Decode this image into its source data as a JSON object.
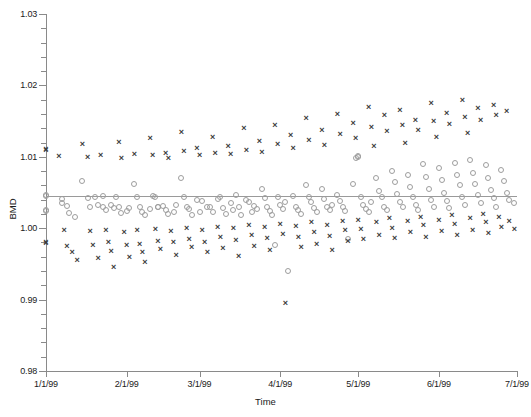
{
  "chart_data": {
    "type": "scatter",
    "title": "",
    "xlabel": "Time",
    "ylabel": "BMD",
    "ylim": [
      0.98,
      1.03
    ],
    "ytick_labels": [
      "0.98",
      "0.99",
      "1.00",
      "1.01",
      "1.02",
      "1.03"
    ],
    "ytick_values": [
      0.98,
      0.99,
      1.0,
      1.01,
      1.02,
      1.03
    ],
    "yminor_step": 0.002,
    "xtick_labels": [
      "1/1/99",
      "2/1/99",
      "3/1/99",
      "4/1/99",
      "5/1/99",
      "6/1/99",
      "7/1/99"
    ],
    "xtick_values": [
      0,
      31,
      59,
      90,
      120,
      151,
      181
    ],
    "xlim": [
      0,
      181
    ],
    "grid": false,
    "legend_position": "none",
    "annotations": [
      {
        "type": "hline",
        "y": 1.0045,
        "color": "#9a9a9a",
        "label": ""
      }
    ],
    "series": [
      {
        "name": "circle-series",
        "marker": "circle",
        "color": "#9d9d9d",
        "points": [
          [
            0,
            1.0045
          ],
          [
            0,
            1.0046
          ],
          [
            0,
            1.0025
          ],
          [
            0,
            1.0024
          ],
          [
            6,
            1.0041
          ],
          [
            6,
            1.0035
          ],
          [
            8,
            1.0031
          ],
          [
            9,
            1.0021
          ],
          [
            11,
            1.0015
          ],
          [
            14,
            1.0066
          ],
          [
            16,
            1.0042
          ],
          [
            17,
            1.003
          ],
          [
            19,
            1.0044
          ],
          [
            20,
            1.0032
          ],
          [
            22,
            1.0045
          ],
          [
            22,
            1.0029
          ],
          [
            23,
            1.0026
          ],
          [
            25,
            1.0033
          ],
          [
            26,
            1.0028
          ],
          [
            27,
            1.0043
          ],
          [
            28,
            1.003
          ],
          [
            29,
            1.0021
          ],
          [
            31,
            1.0024
          ],
          [
            32,
            1.0028
          ],
          [
            34,
            1.0062
          ],
          [
            35,
            1.0044
          ],
          [
            36,
            1.003
          ],
          [
            37,
            1.0022
          ],
          [
            38,
            1.0018
          ],
          [
            40,
            1.0027
          ],
          [
            41,
            1.0045
          ],
          [
            42,
            1.0044
          ],
          [
            43,
            1.003
          ],
          [
            43,
            1.0029
          ],
          [
            45,
            1.0031
          ],
          [
            46,
            1.0025
          ],
          [
            47,
            1.002
          ],
          [
            49,
            1.0022
          ],
          [
            50,
            1.0032
          ],
          [
            52,
            1.007
          ],
          [
            53,
            1.0043
          ],
          [
            54,
            1.0029
          ],
          [
            55,
            1.0027
          ],
          [
            56,
            1.0018
          ],
          [
            58,
            1.0039
          ],
          [
            59,
            1.0023
          ],
          [
            60,
            1.0038
          ],
          [
            62,
            1.0029
          ],
          [
            63,
            1.003
          ],
          [
            64,
            1.0022
          ],
          [
            66,
            1.0041
          ],
          [
            67,
            1.0044
          ],
          [
            68,
            1.0028
          ],
          [
            69,
            1.002
          ],
          [
            71,
            1.0035
          ],
          [
            72,
            1.0026
          ],
          [
            73,
            1.0046
          ],
          [
            74,
            1.0029
          ],
          [
            75,
            1.0018
          ],
          [
            77,
            1.004
          ],
          [
            78,
            1.0036
          ],
          [
            79,
            1.0022
          ],
          [
            80,
            1.0031
          ],
          [
            81,
            1.0027
          ],
          [
            83,
            1.0055
          ],
          [
            84,
            1.0042
          ],
          [
            85,
            1.003
          ],
          [
            86,
            1.0024
          ],
          [
            87,
            1.0019
          ],
          [
            88,
            0.9977
          ],
          [
            89,
            1.0044
          ],
          [
            90,
            1.0033
          ],
          [
            91,
            1.0027
          ],
          [
            92,
            1.0037
          ],
          [
            93,
            0.994
          ],
          [
            95,
            1.0045
          ],
          [
            96,
            1.003
          ],
          [
            97,
            1.0025
          ],
          [
            98,
            1.002
          ],
          [
            100,
            1.006
          ],
          [
            101,
            1.0043
          ],
          [
            102,
            1.0036
          ],
          [
            103,
            1.0028
          ],
          [
            104,
            1.0022
          ],
          [
            106,
            1.0055
          ],
          [
            107,
            1.0041
          ],
          [
            108,
            1.003
          ],
          [
            109,
            1.0026
          ],
          [
            110,
            1.0033
          ],
          [
            112,
            1.0046
          ],
          [
            113,
            1.0038
          ],
          [
            114,
            1.0029
          ],
          [
            115,
            1.0024
          ],
          [
            116,
            0.9985
          ],
          [
            118,
            1.0062
          ],
          [
            119,
            1.0099
          ],
          [
            120,
            1.0101
          ],
          [
            120,
            1.01
          ],
          [
            121,
            1.0044
          ],
          [
            122,
            1.0032
          ],
          [
            123,
            1.0027
          ],
          [
            124,
            1.0022
          ],
          [
            125,
            1.0036
          ],
          [
            127,
            1.007
          ],
          [
            128,
            1.0052
          ],
          [
            129,
            1.0043
          ],
          [
            130,
            1.003
          ],
          [
            131,
            1.0025
          ],
          [
            133,
            1.008
          ],
          [
            134,
            1.0065
          ],
          [
            135,
            1.0048
          ],
          [
            136,
            1.0036
          ],
          [
            137,
            1.0029
          ],
          [
            139,
            1.0075
          ],
          [
            140,
            1.0058
          ],
          [
            141,
            1.0044
          ],
          [
            142,
            1.0032
          ],
          [
            143,
            1.0026
          ],
          [
            145,
            1.009
          ],
          [
            146,
            1.0072
          ],
          [
            147,
            1.0055
          ],
          [
            148,
            1.004
          ],
          [
            149,
            1.003
          ],
          [
            151,
            1.0085
          ],
          [
            152,
            1.0068
          ],
          [
            153,
            1.005
          ],
          [
            154,
            1.0038
          ],
          [
            155,
            1.0028
          ],
          [
            157,
            1.0092
          ],
          [
            158,
            1.0074
          ],
          [
            159,
            1.006
          ],
          [
            160,
            1.0044
          ],
          [
            161,
            1.0033
          ],
          [
            163,
            1.0095
          ],
          [
            164,
            1.0078
          ],
          [
            165,
            1.0062
          ],
          [
            166,
            1.0046
          ],
          [
            167,
            1.0035
          ],
          [
            169,
            1.0088
          ],
          [
            170,
            1.007
          ],
          [
            171,
            1.0054
          ],
          [
            172,
            1.0042
          ],
          [
            173,
            1.003
          ],
          [
            175,
            1.0082
          ],
          [
            176,
            1.0066
          ],
          [
            177,
            1.005
          ],
          [
            178,
            1.004
          ],
          [
            180,
            1.0035
          ]
        ]
      },
      {
        "name": "x-series",
        "marker": "x",
        "color": "#3b3b3b",
        "points": [
          [
            0,
            1.011
          ],
          [
            0,
            1.0111
          ],
          [
            0,
            0.998
          ],
          [
            0,
            0.9979
          ],
          [
            5,
            1.0101
          ],
          [
            7,
            0.9997
          ],
          [
            8,
            0.9975
          ],
          [
            10,
            0.9966
          ],
          [
            12,
            0.9955
          ],
          [
            14,
            1.0118
          ],
          [
            16,
            1.01
          ],
          [
            17,
            0.9996
          ],
          [
            18,
            0.9977
          ],
          [
            20,
            0.9958
          ],
          [
            21,
            1.0103
          ],
          [
            23,
            0.9998
          ],
          [
            24,
            0.998
          ],
          [
            25,
            0.9968
          ],
          [
            26,
            0.9946
          ],
          [
            28,
            1.0121
          ],
          [
            29,
            1.0099
          ],
          [
            30,
            0.9994
          ],
          [
            31,
            0.9976
          ],
          [
            32,
            0.996
          ],
          [
            34,
            1.0104
          ],
          [
            35,
            0.9997
          ],
          [
            36,
            0.9978
          ],
          [
            37,
            0.9967
          ],
          [
            38,
            0.9952
          ],
          [
            40,
            1.0126
          ],
          [
            41,
            1.0102
          ],
          [
            42,
            0.9999
          ],
          [
            43,
            0.9982
          ],
          [
            44,
            0.9971
          ],
          [
            46,
            1.0105
          ],
          [
            47,
            1.0098
          ],
          [
            48,
            0.9996
          ],
          [
            49,
            0.998
          ],
          [
            50,
            0.9963
          ],
          [
            52,
            1.0135
          ],
          [
            53,
            1.0108
          ],
          [
            54,
            1.0
          ],
          [
            55,
            0.9985
          ],
          [
            56,
            0.9974
          ],
          [
            58,
            1.0112
          ],
          [
            59,
            1.0102
          ],
          [
            60,
            0.9998
          ],
          [
            61,
            0.9981
          ],
          [
            62,
            0.9966
          ],
          [
            64,
            1.0128
          ],
          [
            65,
            1.0106
          ],
          [
            66,
            1.0002
          ],
          [
            67,
            0.9988
          ],
          [
            68,
            0.9972
          ],
          [
            70,
            1.0115
          ],
          [
            71,
            1.0104
          ],
          [
            72,
            1.0
          ],
          [
            73,
            0.9983
          ],
          [
            74,
            0.9961
          ],
          [
            76,
            1.014
          ],
          [
            77,
            1.011
          ],
          [
            78,
            1.0004
          ],
          [
            79,
            0.999
          ],
          [
            80,
            0.9975
          ],
          [
            82,
            1.0122
          ],
          [
            83,
            1.0107
          ],
          [
            84,
            1.0001
          ],
          [
            85,
            0.9986
          ],
          [
            86,
            0.997
          ],
          [
            88,
            1.0145
          ],
          [
            89,
            1.0118
          ],
          [
            90,
            1.0006
          ],
          [
            91,
            0.9992
          ],
          [
            92,
            0.9895
          ],
          [
            94,
            1.013
          ],
          [
            95,
            1.0112
          ],
          [
            96,
            1.0003
          ],
          [
            97,
            0.9987
          ],
          [
            98,
            0.9973
          ],
          [
            100,
            1.0155
          ],
          [
            101,
            1.0124
          ],
          [
            102,
            1.0008
          ],
          [
            103,
            0.9995
          ],
          [
            104,
            0.9978
          ],
          [
            106,
            1.0138
          ],
          [
            107,
            1.0116
          ],
          [
            108,
            1.0005
          ],
          [
            109,
            0.9989
          ],
          [
            110,
            0.9969
          ],
          [
            112,
            1.016
          ],
          [
            113,
            1.0132
          ],
          [
            114,
            1.001
          ],
          [
            115,
            0.9997
          ],
          [
            116,
            0.9982
          ],
          [
            118,
            1.0148
          ],
          [
            119,
            1.0126
          ],
          [
            120,
            1.0012
          ],
          [
            121,
            0.9999
          ],
          [
            122,
            0.9985
          ],
          [
            124,
            1.017
          ],
          [
            125,
            1.0142
          ],
          [
            126,
            1.0115
          ],
          [
            127,
            1.0008
          ],
          [
            128,
            0.999
          ],
          [
            130,
            1.0158
          ],
          [
            131,
            1.0136
          ],
          [
            132,
            1.0014
          ],
          [
            133,
            1.0
          ],
          [
            134,
            0.9986
          ],
          [
            136,
            1.0165
          ],
          [
            137,
            1.0144
          ],
          [
            138,
            1.012
          ],
          [
            139,
            1.001
          ],
          [
            140,
            0.9994
          ],
          [
            142,
            1.0152
          ],
          [
            143,
            1.0138
          ],
          [
            144,
            1.0016
          ],
          [
            145,
            1.0004
          ],
          [
            146,
            0.9988
          ],
          [
            148,
            1.0175
          ],
          [
            149,
            1.015
          ],
          [
            150,
            1.0128
          ],
          [
            151,
            1.0012
          ],
          [
            152,
            0.9996
          ],
          [
            154,
            1.0162
          ],
          [
            155,
            1.0146
          ],
          [
            156,
            1.0018
          ],
          [
            157,
            1.0006
          ],
          [
            158,
            0.9991
          ],
          [
            160,
            1.018
          ],
          [
            161,
            1.0156
          ],
          [
            162,
            1.0134
          ],
          [
            163,
            1.0014
          ],
          [
            164,
            0.9998
          ],
          [
            166,
            1.0168
          ],
          [
            167,
            1.0152
          ],
          [
            168,
            1.002
          ],
          [
            169,
            1.0008
          ],
          [
            170,
            0.9993
          ],
          [
            172,
            1.0172
          ],
          [
            173,
            1.0158
          ],
          [
            174,
            1.0016
          ],
          [
            175,
            1.0002
          ],
          [
            177,
            1.0164
          ],
          [
            178,
            1.001
          ],
          [
            180,
            0.9999
          ]
        ]
      }
    ]
  },
  "axes": {
    "y_title": "BMD",
    "x_title": "Time"
  }
}
